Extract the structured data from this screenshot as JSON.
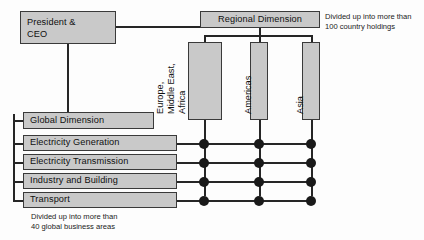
{
  "diagram": {
    "colors": {
      "box_fill": "#c9c9c9",
      "box_border": "#3a3a3a",
      "line": "#262626",
      "dot": "#1a1a1a",
      "background": "#fdfdfd",
      "text": "#101010"
    },
    "top": {
      "ceo_label": "President &\nCEO",
      "ceo_line1": "President &",
      "ceo_line2": "CEO",
      "regional_label": "Regional Dimension"
    },
    "regions": [
      {
        "id": "emea",
        "label": "Europe, Middle East, Africa",
        "lines": [
          "Europe,",
          "Middle East,",
          "Africa"
        ]
      },
      {
        "id": "americas",
        "label": "Americas",
        "lines": [
          "Americas"
        ]
      },
      {
        "id": "asia",
        "label": "Asia",
        "lines": [
          "Asia"
        ]
      }
    ],
    "global_dimension_label": "Global Dimension",
    "business_rows": [
      {
        "id": "electricity-generation",
        "label": "Electricity Generation"
      },
      {
        "id": "electricity-transmission",
        "label": "Electricity Transmission"
      },
      {
        "id": "industry-and-building",
        "label": "Industry and Building"
      },
      {
        "id": "transport",
        "label": "Transport"
      }
    ],
    "notes": {
      "regional": "Divided up into more than\n100 country holdings",
      "global": "Divided up into more than\n40 global business areas"
    },
    "matrix": {
      "rows": [
        "Electricity Generation",
        "Electricity Transmission",
        "Industry and Building",
        "Transport"
      ],
      "columns": [
        "Europe, Middle East, Africa",
        "Americas",
        "Asia"
      ],
      "intersections": [
        [
          true,
          true,
          true
        ],
        [
          true,
          true,
          true
        ],
        [
          true,
          true,
          true
        ],
        [
          true,
          true,
          true
        ]
      ]
    }
  }
}
